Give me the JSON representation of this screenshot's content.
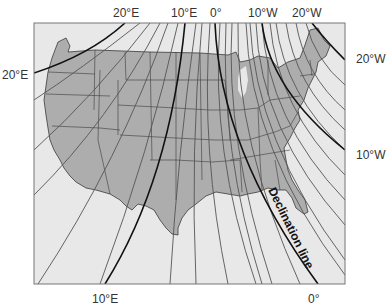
{
  "map": {
    "title": "Magnetic declination map of the contiguous United States",
    "colors": {
      "background": "#ffffff",
      "ocean": "#e8e8e8",
      "land": "#adadad",
      "state_borders": "#3a3a3a",
      "isogonic_lines": "#555555",
      "major_lines": "#111111",
      "frame": "#777777",
      "label_text": "#333333"
    },
    "top_labels": [
      {
        "text": "20°E",
        "x": 113,
        "y": 7
      },
      {
        "text": "10°E",
        "x": 171,
        "y": 7
      },
      {
        "text": "0°",
        "x": 210,
        "y": 7
      },
      {
        "text": "10°W",
        "x": 248,
        "y": 7
      },
      {
        "text": "20°W",
        "x": 292,
        "y": 7
      }
    ],
    "left_labels": [
      {
        "text": "20°E",
        "x": 2,
        "y": 69
      }
    ],
    "right_labels": [
      {
        "text": "20°W",
        "x": 356,
        "y": 53
      },
      {
        "text": "10°W",
        "x": 356,
        "y": 149
      }
    ],
    "bottom_labels": [
      {
        "text": "10°E",
        "x": 92,
        "y": 293
      },
      {
        "text": "0°",
        "x": 308,
        "y": 293
      }
    ],
    "annotation": {
      "text": "Declination line",
      "x": 279,
      "y": 206,
      "rotate": 64
    }
  }
}
